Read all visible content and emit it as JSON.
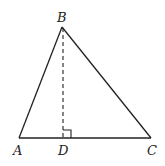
{
  "diagram": {
    "type": "triangle-with-altitude",
    "stroke_color": "#222222",
    "background": "#ffffff",
    "points": {
      "A": {
        "label": "A",
        "x": 19,
        "y": 138
      },
      "B": {
        "label": "B",
        "x": 62,
        "y": 27
      },
      "C": {
        "label": "C",
        "x": 151,
        "y": 138
      },
      "D": {
        "label": "D",
        "x": 63,
        "y": 138
      }
    },
    "segments": [
      {
        "from": "A",
        "to": "B",
        "style": "solid"
      },
      {
        "from": "B",
        "to": "C",
        "style": "solid"
      },
      {
        "from": "A",
        "to": "C",
        "style": "solid"
      },
      {
        "from": "B",
        "to": "D",
        "style": "dashed"
      }
    ],
    "right_angle_marker": {
      "at": "D",
      "size": 8
    }
  }
}
